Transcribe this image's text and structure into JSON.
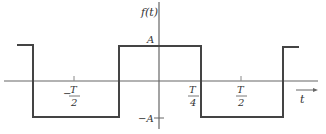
{
  "diagram": {
    "type": "square-wave",
    "y_axis_label": "f(t)",
    "x_axis_label": "t",
    "amplitude_high_label": "A",
    "amplitude_low_label": "−A",
    "tick_labels": [
      {
        "id": "neg-half-period",
        "sign": "−",
        "num": "T",
        "den": "2"
      },
      {
        "id": "quarter-period",
        "sign": "",
        "num": "T",
        "den": "4"
      },
      {
        "id": "half-period",
        "sign": "",
        "num": "T",
        "den": "2"
      }
    ],
    "line_color": "#444444"
  }
}
